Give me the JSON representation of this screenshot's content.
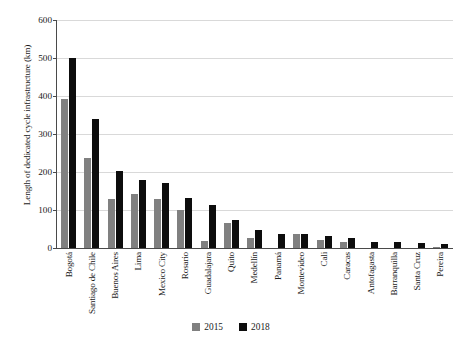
{
  "chart_data": {
    "type": "bar",
    "title": "",
    "subtitle": "",
    "xlabel": "",
    "ylabel": "Length of dedicated cycle infrastructure (km)",
    "ylim": [
      0,
      600
    ],
    "yticks": [
      600,
      500,
      400,
      300,
      200,
      100,
      0
    ],
    "ytick_labels": [
      "600",
      "500",
      "400",
      "300",
      "200",
      "100",
      "0"
    ],
    "grid": "horizontal",
    "legend_position": "bottom-center",
    "categories": [
      "Bogotá",
      "Santiago de Chile",
      "Buenos Aires",
      "Lima",
      "Mexico City",
      "Rosario",
      "Guadalajara",
      "Quito",
      "Medellín",
      "Panamá",
      "Montevideo",
      "Cali",
      "Caracas",
      "Antofagasta",
      "Barranquilla",
      "Santa Cruz",
      "Pereira"
    ],
    "series": [
      {
        "name": "2015",
        "color": "#808080",
        "values": [
          392,
          236,
          130,
          141,
          129,
          101,
          18,
          65,
          27,
          0,
          36,
          21,
          15,
          0,
          0,
          0,
          3
        ]
      },
      {
        "name": "2018",
        "color": "#0d0d0d",
        "values": [
          500,
          340,
          202,
          180,
          170,
          131,
          112,
          73,
          47,
          36,
          36,
          31,
          26,
          17,
          15,
          12,
          10
        ]
      }
    ]
  },
  "legend": {
    "items": [
      {
        "label": "2015",
        "color": "#808080"
      },
      {
        "label": "2018",
        "color": "#0d0d0d"
      }
    ]
  },
  "colors": {
    "axis": "#4a4a4a",
    "gridline": "#d9d9d9",
    "background": "#ffffff",
    "series_2015": "#808080",
    "series_2018": "#0d0d0d"
  }
}
